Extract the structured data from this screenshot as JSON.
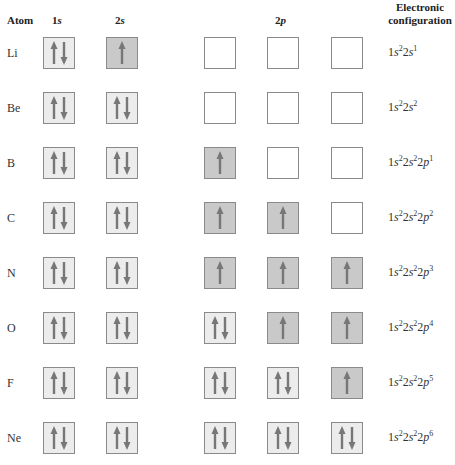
{
  "headers": {
    "atom": "Atom",
    "col_1s": {
      "num": "1",
      "orb": "s"
    },
    "col_2s": {
      "num": "2",
      "orb": "s"
    },
    "col_2p": {
      "num": "2",
      "orb": "p"
    },
    "config_line1": "Electronic",
    "config_line2": "configuration"
  },
  "colors": {
    "paired_fill": "#ececec",
    "single_fill": "#c9c9c9",
    "empty_fill": "#ffffff",
    "border": "#8a8a8a",
    "arrow": "#777777"
  },
  "rows": [
    {
      "atom": "Li",
      "orbitals": [
        "paired",
        "single",
        "empty",
        "empty",
        "empty"
      ],
      "config": [
        [
          "1",
          "s",
          "2"
        ],
        [
          "2",
          "s",
          "1"
        ]
      ]
    },
    {
      "atom": "Be",
      "orbitals": [
        "paired",
        "paired",
        "empty",
        "empty",
        "empty"
      ],
      "config": [
        [
          "1",
          "s",
          "2"
        ],
        [
          "2",
          "s",
          "2"
        ]
      ]
    },
    {
      "atom": "B",
      "orbitals": [
        "paired",
        "paired",
        "single",
        "empty",
        "empty"
      ],
      "config": [
        [
          "1",
          "s",
          "2"
        ],
        [
          "2",
          "s",
          "2"
        ],
        [
          "2",
          "p",
          "1"
        ]
      ]
    },
    {
      "atom": "C",
      "orbitals": [
        "paired",
        "paired",
        "single",
        "single",
        "empty"
      ],
      "config": [
        [
          "1",
          "s",
          "2"
        ],
        [
          "2",
          "s",
          "2"
        ],
        [
          "2",
          "p",
          "2"
        ]
      ]
    },
    {
      "atom": "N",
      "orbitals": [
        "paired",
        "paired",
        "single",
        "single",
        "single"
      ],
      "config": [
        [
          "1",
          "s",
          "2"
        ],
        [
          "2",
          "s",
          "2"
        ],
        [
          "2",
          "p",
          "3"
        ]
      ]
    },
    {
      "atom": "O",
      "orbitals": [
        "paired",
        "paired",
        "paired",
        "single",
        "single"
      ],
      "config": [
        [
          "1",
          "s",
          "2"
        ],
        [
          "2",
          "s",
          "2"
        ],
        [
          "2",
          "p",
          "4"
        ]
      ]
    },
    {
      "atom": "F",
      "orbitals": [
        "paired",
        "paired",
        "paired",
        "paired",
        "single"
      ],
      "config": [
        [
          "1",
          "s",
          "2"
        ],
        [
          "2",
          "s",
          "2"
        ],
        [
          "2",
          "p",
          "5"
        ]
      ]
    },
    {
      "atom": "Ne",
      "orbitals": [
        "paired",
        "paired",
        "paired",
        "paired",
        "paired"
      ],
      "config": [
        [
          "1",
          "s",
          "2"
        ],
        [
          "2",
          "s",
          "2"
        ],
        [
          "2",
          "p",
          "6"
        ]
      ]
    }
  ]
}
